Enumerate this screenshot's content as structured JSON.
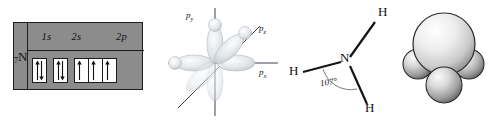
{
  "figure": {
    "caption_present": false,
    "panels": [
      "orbital-box-diagram",
      "p-orbital-axes",
      "ammonia-structure",
      "space-filling-model"
    ]
  },
  "orbital_table": {
    "element_symbol": "N",
    "atomic_number": "7",
    "subshells": [
      {
        "label": "1s",
        "boxes": [
          {
            "electrons": [
              "up",
              "down"
            ]
          }
        ]
      },
      {
        "label": "2s",
        "boxes": [
          {
            "electrons": [
              "up",
              "down"
            ]
          }
        ]
      },
      {
        "label": "2p",
        "boxes": [
          {
            "electrons": [
              "up"
            ]
          },
          {
            "electrons": [
              "up"
            ]
          },
          {
            "electrons": [
              "up"
            ]
          }
        ]
      }
    ],
    "background_color": "#8c8c8c",
    "border_color": "#1c1c1c",
    "box_fill_color": "#fdfdfd"
  },
  "p_orbitals": {
    "axis_labels": [
      {
        "name": "p_y",
        "base": "p",
        "sub": "y"
      },
      {
        "name": "p_z",
        "base": "p",
        "sub": "z"
      },
      {
        "name": "p_x",
        "base": "p",
        "sub": "x"
      }
    ],
    "lobe_color": "#d6d9dc",
    "axis_color": "#3c3f52",
    "orbital_count": 3
  },
  "ammonia": {
    "central_atom": "N",
    "hydrogens": [
      "H",
      "H",
      "H"
    ],
    "bond_angle": "107°",
    "bond_color": "#151515",
    "arc_color": "#6d6d6d"
  },
  "space_filling": {
    "atoms": [
      {
        "element": "N",
        "role": "central"
      },
      {
        "element": "H",
        "role": "terminal"
      },
      {
        "element": "H",
        "role": "terminal"
      },
      {
        "element": "H",
        "role": "terminal"
      }
    ],
    "sphere_color": "#e8e8e8",
    "outline_color": "#2a2a2a"
  }
}
